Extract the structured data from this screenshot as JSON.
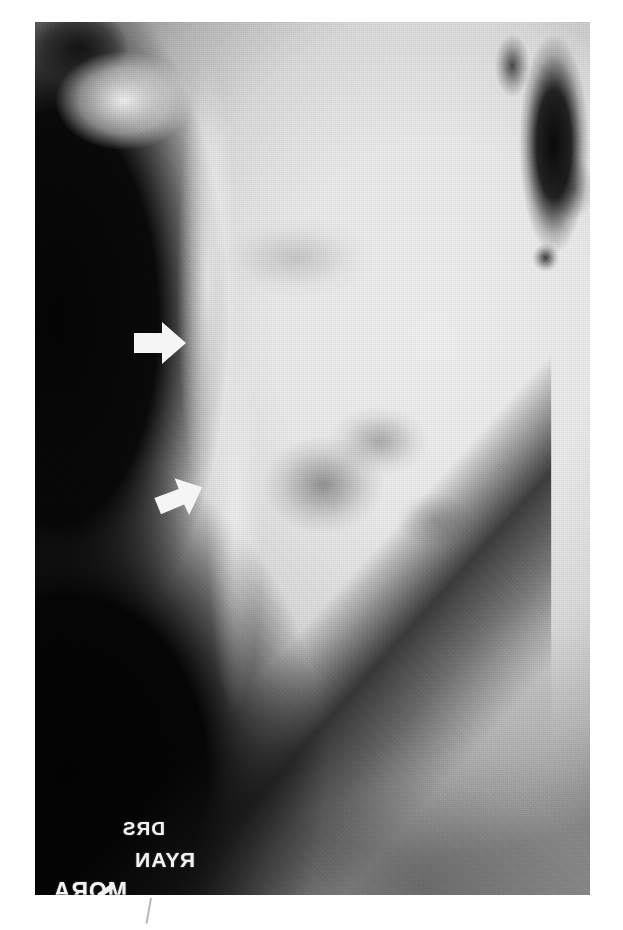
{
  "figure": {
    "kind": "radiograph",
    "modality": "plain-film x-ray",
    "view": "lateral",
    "region": "neck / skull base soft tissue",
    "media_caption": "",
    "background_color": "#ffffff",
    "plate": {
      "left": 35,
      "top": 22,
      "width": 555,
      "height": 873,
      "film_dark": "#0a0a0a",
      "film_bright": "#f2f2f2"
    }
  },
  "annotations": {
    "arrow_color": "#f3f3f3",
    "arrows": [
      {
        "id": "upper-arrow",
        "label": "upper-annotation-arrow",
        "direction": "right",
        "rotation_deg": 0,
        "x": 97,
        "y": 297,
        "width": 56,
        "height": 48
      },
      {
        "id": "lower-arrow",
        "label": "lower-annotation-arrow",
        "direction": "up-right",
        "rotation_deg": -16,
        "x": 117,
        "y": 452,
        "width": 54,
        "height": 46
      }
    ]
  },
  "markers": {
    "note": "lead identification markers, rendered mirror-reversed on the film",
    "items": [
      {
        "id": "marker-drs",
        "text": "DRS",
        "mirrored": true
      },
      {
        "id": "marker-ryan",
        "text": "RYAN",
        "mirrored": true
      },
      {
        "id": "marker-extra",
        "text": "MORA",
        "mirrored": true
      }
    ]
  },
  "features": {
    "air_column_upper_left": "radiolucent air anterior to the soft tissues",
    "air_column_upper_right": "dark gas-filled nasopharyngeal airway",
    "bright_mass": "dense opacified soft-tissue / bony mass",
    "diagonal_band": "inferior dark diagonal soft tissue border"
  }
}
